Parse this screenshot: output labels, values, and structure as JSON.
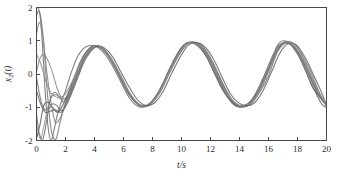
{
  "chart_data": {
    "type": "line",
    "title": "",
    "xlabel": "t/s",
    "ylabel": "x2(t)",
    "ylabel_base": "x",
    "ylabel_sub": "2",
    "ylabel_tail": "(t)",
    "xlim": [
      0,
      20
    ],
    "ylim": [
      -2,
      2
    ],
    "xticks": [
      0,
      2,
      4,
      6,
      8,
      10,
      12,
      14,
      16,
      18,
      20
    ],
    "xtick_labels": [
      "0",
      "2",
      "4",
      "6",
      "8",
      "10",
      "12",
      "14",
      "16",
      "18",
      "20"
    ],
    "yticks": [
      -2,
      -1,
      0,
      1,
      2
    ],
    "ytick_labels": [
      "-2",
      "-1",
      "0",
      "1",
      "2"
    ],
    "grid": false,
    "legend": null,
    "frame": true,
    "line_color": "#808080",
    "axis_color": "#4a4a4a",
    "background": "#ffffff",
    "annotations": [
      "Multiple trajectories from different initial conditions converge to a common periodic orbit",
      "Steady-state oscillation period approximately 6.4 s",
      "Steady-state amplitude approximately +/-1",
      "Peaks near t = 4.0, 10.3, 16.6",
      "Troughs near t = 7.2, 13.5, 19.8"
    ],
    "series": [
      {
        "name": "trajectory-1",
        "color": "#707070",
        "width": 1.1,
        "x": [
          0,
          0.15,
          0.3,
          0.45,
          0.6,
          0.8,
          1.0,
          1.2,
          1.45,
          1.7,
          2.0,
          2.4,
          2.8,
          3.2,
          3.6,
          4.0,
          4.4,
          4.8,
          5.2,
          5.6,
          6.0,
          6.4,
          6.8,
          7.2,
          7.6,
          8.0,
          8.6,
          9.2,
          9.8,
          10.3,
          10.8,
          11.4,
          12.0,
          12.6,
          13.1,
          13.5,
          14.0,
          14.6,
          15.2,
          15.8,
          16.3,
          16.6,
          17.0,
          17.6,
          18.2,
          18.8,
          19.3,
          19.7,
          20.0
        ],
        "y": [
          2.0,
          1.95,
          1.55,
          0.6,
          -0.55,
          -1.6,
          -2.0,
          -1.7,
          -1.2,
          -0.85,
          -0.5,
          0.05,
          0.5,
          0.75,
          0.85,
          0.84,
          0.74,
          0.55,
          0.28,
          -0.05,
          -0.4,
          -0.72,
          -0.92,
          -1.0,
          -0.95,
          -0.8,
          -0.42,
          0.1,
          0.6,
          0.9,
          0.95,
          0.8,
          0.42,
          -0.12,
          -0.6,
          -0.88,
          -1.0,
          -0.92,
          -0.6,
          -0.12,
          0.5,
          0.85,
          1.0,
          0.88,
          0.5,
          -0.05,
          -0.6,
          -0.92,
          -1.0
        ]
      },
      {
        "name": "trajectory-2",
        "color": "#787878",
        "width": 1.1,
        "x": [
          0,
          0.15,
          0.3,
          0.5,
          0.7,
          0.9,
          1.1,
          1.35,
          1.6,
          1.9,
          2.3,
          2.7,
          3.1,
          3.5,
          3.9,
          4.3,
          4.7,
          5.1,
          5.5,
          5.9,
          6.3,
          6.7,
          7.1,
          7.5,
          7.9,
          8.5,
          9.1,
          9.7,
          10.3,
          10.9,
          11.5,
          12.1,
          12.7,
          13.3,
          13.7,
          14.2,
          14.8,
          15.4,
          16.0,
          16.5,
          16.8,
          17.2,
          17.8,
          18.4,
          19.0,
          19.5,
          20.0
        ],
        "y": [
          1.75,
          1.9,
          1.7,
          0.9,
          -0.3,
          -1.3,
          -1.85,
          -1.95,
          -1.5,
          -1.0,
          -0.5,
          -0.05,
          0.4,
          0.7,
          0.84,
          0.82,
          0.7,
          0.48,
          0.2,
          -0.15,
          -0.5,
          -0.78,
          -0.95,
          -0.98,
          -0.88,
          -0.5,
          0.05,
          0.55,
          0.9,
          0.95,
          0.78,
          0.38,
          -0.18,
          -0.65,
          -0.88,
          -1.0,
          -0.9,
          -0.55,
          -0.05,
          0.55,
          0.82,
          0.98,
          0.9,
          0.52,
          -0.02,
          -0.55,
          -0.95
        ]
      },
      {
        "name": "trajectory-3",
        "color": "#8a8a8a",
        "width": 1.1,
        "x": [
          0,
          0.2,
          0.4,
          0.6,
          0.85,
          1.1,
          1.4,
          1.7,
          2.0,
          2.4,
          2.8,
          3.2,
          3.6,
          4.0,
          4.4,
          4.8,
          5.2,
          5.6,
          6.0,
          6.5,
          7.0,
          7.4,
          7.8,
          8.3,
          8.9,
          9.5,
          10.1,
          10.5,
          11.0,
          11.6,
          12.2,
          12.8,
          13.4,
          13.8,
          14.3,
          14.9,
          15.5,
          16.1,
          16.6,
          17.1,
          17.7,
          18.3,
          18.9,
          19.4,
          20.0
        ],
        "y": [
          0.05,
          0.42,
          0.58,
          0.55,
          0.35,
          0.05,
          -0.4,
          -0.7,
          -0.72,
          -0.45,
          -0.05,
          0.38,
          0.7,
          0.85,
          0.8,
          0.62,
          0.35,
          0.02,
          -0.35,
          -0.7,
          -0.92,
          -0.98,
          -0.9,
          -0.65,
          -0.15,
          0.4,
          0.82,
          0.95,
          0.88,
          0.6,
          0.1,
          -0.45,
          -0.8,
          -0.95,
          -0.98,
          -0.82,
          -0.4,
          0.2,
          0.7,
          0.95,
          0.88,
          0.52,
          -0.02,
          -0.5,
          -0.95
        ]
      },
      {
        "name": "trajectory-4",
        "color": "#6e6e6e",
        "width": 1.1,
        "x": [
          0,
          0.2,
          0.4,
          0.6,
          0.85,
          1.1,
          1.4,
          1.75,
          2.1,
          2.5,
          2.9,
          3.3,
          3.7,
          4.1,
          4.5,
          4.9,
          5.3,
          5.7,
          6.1,
          6.6,
          7.0,
          7.5,
          8.0,
          8.6,
          9.2,
          9.8,
          10.4,
          10.9,
          11.5,
          12.1,
          12.7,
          13.2,
          13.6,
          14.1,
          14.7,
          15.3,
          15.9,
          16.5,
          17.0,
          17.6,
          18.2,
          18.8,
          19.3,
          20.0
        ],
        "y": [
          -0.1,
          -0.6,
          -0.95,
          -1.08,
          -1.05,
          -0.9,
          -0.95,
          -1.1,
          -0.85,
          -0.42,
          0.05,
          0.45,
          0.72,
          0.84,
          0.8,
          0.62,
          0.35,
          0.0,
          -0.35,
          -0.72,
          -0.9,
          -0.98,
          -0.85,
          -0.5,
          0.05,
          0.55,
          0.9,
          0.95,
          0.8,
          0.4,
          -0.15,
          -0.6,
          -0.85,
          -0.98,
          -0.88,
          -0.5,
          0.05,
          0.62,
          0.92,
          0.88,
          0.52,
          -0.02,
          -0.52,
          -0.95
        ]
      },
      {
        "name": "trajectory-5",
        "color": "#999999",
        "width": 1.1,
        "x": [
          0,
          0.25,
          0.5,
          0.75,
          1.0,
          1.3,
          1.6,
          1.95,
          2.35,
          2.75,
          3.15,
          3.55,
          3.95,
          4.35,
          4.75,
          5.15,
          5.55,
          6.0,
          6.4,
          6.9,
          7.3,
          7.8,
          8.4,
          9.0,
          9.6,
          10.2,
          10.7,
          11.3,
          11.9,
          12.5,
          13.1,
          13.6,
          14.1,
          14.7,
          15.3,
          15.9,
          16.4,
          16.9,
          17.5,
          18.1,
          18.7,
          19.2,
          20.0
        ],
        "y": [
          -1.5,
          -1.95,
          -1.6,
          -1.05,
          -0.72,
          -0.62,
          -0.7,
          -0.78,
          -0.55,
          -0.15,
          0.3,
          0.62,
          0.8,
          0.82,
          0.7,
          0.48,
          0.18,
          -0.2,
          -0.55,
          -0.85,
          -0.96,
          -0.92,
          -0.62,
          -0.1,
          0.45,
          0.85,
          0.95,
          0.85,
          0.48,
          -0.08,
          -0.58,
          -0.85,
          -0.98,
          -0.9,
          -0.55,
          0.0,
          0.55,
          0.9,
          0.9,
          0.58,
          0.02,
          -0.48,
          -0.95
        ]
      },
      {
        "name": "trajectory-6",
        "color": "#606060",
        "width": 1.1,
        "x": [
          0,
          0.25,
          0.5,
          0.8,
          1.1,
          1.45,
          1.8,
          2.2,
          2.6,
          3.0,
          3.4,
          3.8,
          4.2,
          4.6,
          5.0,
          5.4,
          5.8,
          6.2,
          6.7,
          7.1,
          7.6,
          8.2,
          8.8,
          9.4,
          10.0,
          10.5,
          11.1,
          11.7,
          12.3,
          12.9,
          13.4,
          13.9,
          14.5,
          15.1,
          15.7,
          16.3,
          16.8,
          17.4,
          18.0,
          18.6,
          19.1,
          20.0
        ],
        "y": [
          -1.95,
          -1.5,
          -0.95,
          -0.85,
          -1.0,
          -1.15,
          -0.95,
          -0.55,
          -0.1,
          0.35,
          0.65,
          0.82,
          0.84,
          0.72,
          0.52,
          0.22,
          -0.12,
          -0.45,
          -0.78,
          -0.93,
          -0.95,
          -0.72,
          -0.22,
          0.35,
          0.8,
          0.95,
          0.88,
          0.55,
          0.0,
          -0.52,
          -0.82,
          -0.96,
          -0.92,
          -0.6,
          -0.05,
          0.55,
          0.88,
          0.92,
          0.6,
          0.05,
          -0.45,
          -0.95
        ]
      },
      {
        "name": "trajectory-7",
        "color": "#858585",
        "width": 1.1,
        "x": [
          0,
          0.2,
          0.45,
          0.7,
          1.0,
          1.3,
          1.65,
          2.05,
          2.45,
          2.85,
          3.25,
          3.65,
          4.05,
          4.45,
          4.85,
          5.25,
          5.65,
          6.1,
          6.55,
          7.0,
          7.45,
          8.0,
          8.6,
          9.2,
          9.8,
          10.35,
          10.9,
          11.5,
          12.1,
          12.7,
          13.25,
          13.75,
          14.3,
          14.9,
          15.5,
          16.1,
          16.6,
          17.2,
          17.8,
          18.4,
          19.0,
          19.5,
          20.0
        ],
        "y": [
          1.2,
          1.55,
          1.1,
          0.1,
          -0.85,
          -1.45,
          -1.3,
          -0.88,
          -0.42,
          0.05,
          0.45,
          0.72,
          0.85,
          0.8,
          0.62,
          0.34,
          0.0,
          -0.38,
          -0.72,
          -0.92,
          -0.98,
          -0.8,
          -0.38,
          0.18,
          0.65,
          0.92,
          0.92,
          0.72,
          0.3,
          -0.28,
          -0.7,
          -0.92,
          -0.95,
          -0.75,
          -0.28,
          0.35,
          0.8,
          0.95,
          0.78,
          0.35,
          -0.22,
          -0.65,
          -0.95
        ]
      },
      {
        "name": "trajectory-8",
        "color": "#737373",
        "width": 1.1,
        "x": [
          0,
          0.2,
          0.45,
          0.7,
          0.95,
          1.25,
          1.55,
          1.9,
          2.3,
          2.7,
          3.1,
          3.5,
          3.9,
          4.3,
          4.7,
          5.1,
          5.5,
          5.95,
          6.4,
          6.85,
          7.3,
          7.85,
          8.45,
          9.05,
          9.65,
          10.2,
          10.75,
          11.35,
          11.95,
          12.55,
          13.1,
          13.6,
          14.15,
          14.75,
          15.35,
          15.95,
          16.5,
          17.05,
          17.65,
          18.25,
          18.85,
          19.4,
          20.0
        ],
        "y": [
          -1.2,
          -1.8,
          -1.95,
          -1.4,
          -0.78,
          -0.55,
          -0.68,
          -0.85,
          -0.6,
          -0.18,
          0.28,
          0.62,
          0.8,
          0.82,
          0.7,
          0.45,
          0.15,
          -0.25,
          -0.6,
          -0.86,
          -0.96,
          -0.88,
          -0.55,
          0.0,
          0.52,
          0.88,
          0.95,
          0.82,
          0.42,
          -0.15,
          -0.62,
          -0.86,
          -0.96,
          -0.86,
          -0.48,
          0.1,
          0.62,
          0.92,
          0.86,
          0.5,
          -0.05,
          -0.55,
          -0.95
        ]
      },
      {
        "name": "trajectory-9",
        "color": "#909090",
        "width": 1.1,
        "x": [
          0,
          0.3,
          0.6,
          0.9,
          1.2,
          1.55,
          1.95,
          2.35,
          2.75,
          3.15,
          3.55,
          3.95,
          4.35,
          4.75,
          5.15,
          5.6,
          6.05,
          6.5,
          6.95,
          7.4,
          7.95,
          8.55,
          9.15,
          9.75,
          10.3,
          10.85,
          11.45,
          12.05,
          12.65,
          13.2,
          13.7,
          14.25,
          14.85,
          15.45,
          16.05,
          16.6,
          17.15,
          17.75,
          18.35,
          18.95,
          19.5,
          20.0
        ],
        "y": [
          0.6,
          0.3,
          -0.15,
          -0.5,
          -0.65,
          -0.72,
          -0.62,
          -0.32,
          0.05,
          0.42,
          0.68,
          0.82,
          0.81,
          0.68,
          0.44,
          0.1,
          -0.28,
          -0.62,
          -0.86,
          -0.96,
          -0.86,
          -0.5,
          0.05,
          0.55,
          0.9,
          0.94,
          0.8,
          0.4,
          -0.18,
          -0.62,
          -0.86,
          -0.96,
          -0.85,
          -0.45,
          0.12,
          0.65,
          0.92,
          0.85,
          0.48,
          -0.08,
          -0.58,
          -0.95
        ]
      },
      {
        "name": "trajectory-10",
        "color": "#666666",
        "width": 1.1,
        "x": [
          0,
          0.3,
          0.6,
          0.95,
          1.3,
          1.7,
          2.1,
          2.5,
          2.9,
          3.3,
          3.7,
          4.1,
          4.5,
          4.9,
          5.3,
          5.75,
          6.2,
          6.65,
          7.1,
          7.55,
          8.1,
          8.7,
          9.3,
          9.9,
          10.45,
          11.0,
          11.6,
          12.2,
          12.8,
          13.35,
          13.85,
          14.4,
          15.0,
          15.6,
          16.2,
          16.75,
          17.3,
          17.9,
          18.5,
          19.1,
          19.6,
          20.0
        ],
        "y": [
          -0.5,
          -0.92,
          -1.15,
          -1.12,
          -1.08,
          -1.15,
          -0.9,
          -0.5,
          -0.05,
          0.38,
          0.66,
          0.82,
          0.83,
          0.7,
          0.48,
          0.12,
          -0.25,
          -0.58,
          -0.84,
          -0.95,
          -0.88,
          -0.55,
          0.0,
          0.5,
          0.86,
          0.95,
          0.82,
          0.45,
          -0.1,
          -0.58,
          -0.84,
          -0.95,
          -0.88,
          -0.52,
          0.05,
          0.6,
          0.9,
          0.88,
          0.52,
          -0.02,
          -0.5,
          -0.92
        ]
      }
    ]
  }
}
